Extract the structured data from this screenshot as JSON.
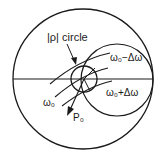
{
  "diagram": {
    "type": "smith-chart",
    "stroke_color": "#1a1a1a",
    "background": "#ffffff",
    "labels": {
      "rho_circle": "|ρ| circle",
      "omega0_minus": "ω₀−Δω",
      "omega0_plus": "ω₀+Δω",
      "omega0": "ω₀",
      "p0": "P₀"
    }
  }
}
